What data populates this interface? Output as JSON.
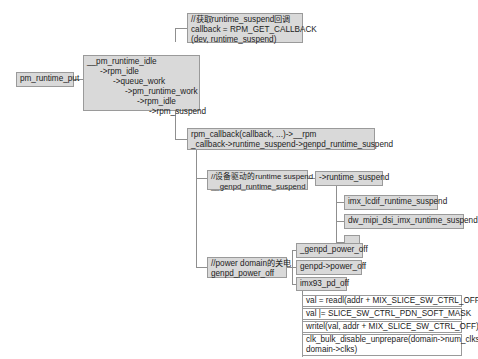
{
  "diagram": {
    "root": {
      "label": "pm_runtime_put"
    },
    "idle_chain": {
      "lines": [
        "__pm_runtime_idle",
        "->rpm_idle",
        "->queue_work",
        "->pm_runtime_work",
        "->rpm_idle",
        "->rpm_suspend"
      ]
    },
    "get_callback": {
      "lines": [
        "//获取runtime_suspend回调",
        "callback = RPM_GET_CALLBACK",
        "(dev, runtime_suspend)"
      ]
    },
    "rpm_callback": {
      "lines": [
        "rpm_callback(callback, ...)->__rpm",
        "_callback->runtime_suspend->genpd_runtime_suspend"
      ]
    },
    "genpd_runtime_suspend": {
      "lines": [
        "//设备驱动的runtime suspend",
        "__genpd_runtime_suspend"
      ]
    },
    "runtime_suspend": {
      "label": "->runtime_suspend"
    },
    "driver_suspends": [
      {
        "label": "imx_lcdif_runtime_suspend"
      },
      {
        "label": "dw_mipi_dsi_imx_runtime_suspend"
      },
      {
        "label": "......"
      }
    ],
    "genpd_power_off": {
      "lines": [
        "//power domain的关电",
        "genpd_power_off"
      ]
    },
    "power_off_children": [
      {
        "label": "_genpd_power_off"
      },
      {
        "label": "genpd->power_off"
      },
      {
        "label": "imx93_pd_off"
      }
    ],
    "pd_off_steps": [
      "val = readl(addr + MIX_SLICE_SW_CTRL_OFF)",
      "val |= SLICE_SW_CTRL_PDN_SOFT_MASK",
      "writel(val, addr + MIX_SLICE_SW_CTRL_OFF)",
      "clk_bulk_disable_unprepare(domain->num_clks,",
      "domain->clks)"
    ],
    "colors": {
      "node_fill": "#d9d9d9",
      "border": "#9a9a9a",
      "connector": "#8f8f8f"
    }
  }
}
